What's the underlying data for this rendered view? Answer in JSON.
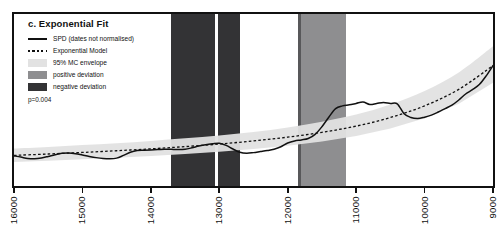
{
  "figure": {
    "panel_label": "c. Exponential Fit",
    "p_value_text": "p=0.004"
  },
  "legend": {
    "items": [
      {
        "key": "solid-line",
        "label": "SPD (dates not normalised)"
      },
      {
        "key": "dashed-line",
        "label": "Exponential Model"
      },
      {
        "key": "light-swatch",
        "label": "95% MC envelope"
      },
      {
        "key": "medium-swatch",
        "label": "positive deviation"
      },
      {
        "key": "dark-swatch",
        "label": "negative deviation"
      }
    ]
  },
  "colors": {
    "spd_line": "#111111",
    "model_line": "#111111",
    "envelope": "#e2e2e2",
    "positive_deviation": "#8e8e90",
    "negative_deviation": "#333335",
    "frame": "#111111",
    "background": "#ffffff"
  },
  "chart_data": {
    "type": "line",
    "title": "c. Exponential Fit",
    "xlabel": "",
    "ylabel": "",
    "xlim": [
      16000,
      9000
    ],
    "x_axis_reversed": true,
    "grid": false,
    "legend_position": "top-left",
    "annotations": [
      {
        "text": "p=0.004",
        "position": "top-left"
      }
    ],
    "tick_labels": [
      "16000",
      "15000",
      "14000",
      "13000",
      "12000",
      "11000",
      "10000",
      "9000"
    ],
    "tick_values": [
      16000,
      15000,
      14000,
      13000,
      12000,
      11000,
      10000,
      9000
    ],
    "ylim": [
      0,
      1
    ],
    "y_axis_labeled": false,
    "series": [
      {
        "name": "SPD (dates not normalised)",
        "style": "solid",
        "x": [
          16000,
          15900,
          15800,
          15700,
          15600,
          15500,
          15400,
          15300,
          15200,
          15100,
          15000,
          14900,
          14800,
          14700,
          14600,
          14500,
          14400,
          14300,
          14200,
          14100,
          14000,
          13900,
          13800,
          13700,
          13600,
          13500,
          13400,
          13300,
          13200,
          13100,
          13000,
          12900,
          12800,
          12700,
          12600,
          12500,
          12400,
          12300,
          12200,
          12100,
          12000,
          11900,
          11800,
          11700,
          11600,
          11500,
          11400,
          11300,
          11200,
          11100,
          11000,
          10900,
          10800,
          10700,
          10600,
          10500,
          10400,
          10300,
          10200,
          10100,
          10000,
          9900,
          9800,
          9700,
          9600,
          9500,
          9400,
          9300,
          9200,
          9100,
          9000
        ],
        "y": [
          0.175,
          0.168,
          0.16,
          0.158,
          0.163,
          0.172,
          0.182,
          0.19,
          0.192,
          0.188,
          0.18,
          0.172,
          0.165,
          0.16,
          0.158,
          0.162,
          0.178,
          0.196,
          0.206,
          0.208,
          0.21,
          0.212,
          0.214,
          0.213,
          0.212,
          0.214,
          0.222,
          0.232,
          0.24,
          0.245,
          0.248,
          0.236,
          0.215,
          0.196,
          0.19,
          0.194,
          0.2,
          0.206,
          0.214,
          0.228,
          0.25,
          0.262,
          0.268,
          0.276,
          0.3,
          0.345,
          0.4,
          0.45,
          0.466,
          0.472,
          0.48,
          0.488,
          0.474,
          0.48,
          0.486,
          0.48,
          0.478,
          0.42,
          0.398,
          0.392,
          0.4,
          0.412,
          0.43,
          0.45,
          0.47,
          0.5,
          0.535,
          0.56,
          0.59,
          0.64,
          0.7
        ]
      },
      {
        "name": "Exponential Model",
        "style": "dashed",
        "x": [
          16000,
          15500,
          15000,
          14500,
          14000,
          13500,
          13000,
          12500,
          12000,
          11500,
          11000,
          10500,
          10000,
          9500,
          9000
        ],
        "y": [
          0.178,
          0.186,
          0.195,
          0.205,
          0.216,
          0.229,
          0.244,
          0.262,
          0.284,
          0.312,
          0.348,
          0.398,
          0.466,
          0.562,
          0.7
        ]
      }
    ],
    "envelope": {
      "name": "95% MC envelope",
      "x": [
        16000,
        15500,
        15000,
        14500,
        14000,
        13500,
        13000,
        12500,
        12000,
        11500,
        11000,
        10500,
        10000,
        9500,
        9000
      ],
      "lower": [
        0.14,
        0.147,
        0.155,
        0.164,
        0.174,
        0.186,
        0.199,
        0.215,
        0.234,
        0.258,
        0.29,
        0.334,
        0.394,
        0.478,
        0.6
      ],
      "upper": [
        0.218,
        0.227,
        0.238,
        0.249,
        0.262,
        0.277,
        0.294,
        0.314,
        0.34,
        0.374,
        0.416,
        0.474,
        0.552,
        0.66,
        0.812
      ]
    },
    "deviation_bands": [
      {
        "type": "negative",
        "x_start": 13700,
        "x_end": 12690,
        "color": "#333335"
      },
      {
        "type": "positive",
        "x_start": 11800,
        "x_end": 11150,
        "color": "#8e8e90"
      }
    ],
    "marker_lines": [
      {
        "x": 13040,
        "color": "#ffffff",
        "width_px": 3
      },
      {
        "x": 11830,
        "color": "#58585a",
        "width_px": 3
      }
    ]
  }
}
